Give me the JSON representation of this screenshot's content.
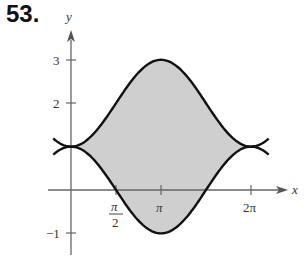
{
  "problem_number": "53.",
  "chart_data": {
    "type": "area",
    "title": "",
    "xlabel": "x",
    "ylabel": "y",
    "x_ticks": [
      "π/2",
      "π",
      "2π"
    ],
    "y_ticks": [
      "3",
      "2",
      "−1"
    ],
    "xlim": [
      -0.6,
      2.3
    ],
    "ylim": [
      -1.35,
      3.6
    ],
    "series": [
      {
        "name": "upper",
        "expression": "y = 2 - cos x",
        "x": [
          -0.5,
          0,
          1.571,
          3.1416,
          4.712,
          6.283,
          6.8
        ],
        "values": [
          1.12,
          1,
          2,
          3,
          2,
          1,
          1.12
        ]
      },
      {
        "name": "lower",
        "expression": "y = cos x",
        "x": [
          -0.5,
          0,
          1.571,
          3.1416,
          4.712,
          6.283,
          6.8
        ],
        "values": [
          0.88,
          1,
          0,
          -1,
          0,
          1,
          0.88
        ]
      }
    ],
    "shaded_region": "between y = cos x and y = 2 - cos x for 0 ≤ x ≤ 2π",
    "colors": {
      "curve": "#111111",
      "fill": "#cfcfcf",
      "axis": "#555555"
    }
  },
  "labels": {
    "x_axis": "x",
    "y_axis": "y",
    "tick_pi_num": "π",
    "tick_pi_den": "2",
    "tick_pi": "π",
    "tick_2pi": "2π",
    "tick_3": "3",
    "tick_2": "2",
    "tick_neg1": "−1"
  }
}
